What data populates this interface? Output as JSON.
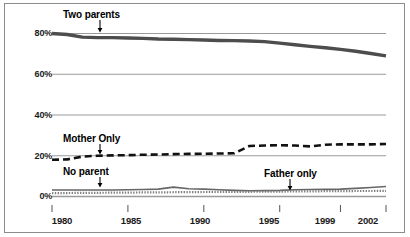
{
  "chart_data": {
    "type": "line",
    "title": "",
    "subtitle": "",
    "xlabel": "",
    "ylabel": "",
    "xlim": [
      1980,
      2002
    ],
    "ylim": [
      0,
      90
    ],
    "yticks": [
      "0%",
      "20%",
      "40%",
      "60%",
      "80%"
    ],
    "ytick_values": [
      0,
      20,
      40,
      60,
      80
    ],
    "xticks": [
      "1980",
      "1985",
      "1990",
      "1995",
      "1999",
      "2002"
    ],
    "xtick_values": [
      1980,
      1985,
      1990,
      1995,
      1999,
      2002
    ],
    "grid": "horizontal",
    "legend_position": "inline-annotations",
    "x": [
      1980,
      1981,
      1982,
      1983,
      1984,
      1985,
      1986,
      1987,
      1988,
      1989,
      1990,
      1991,
      1992,
      1993,
      1994,
      1995,
      1996,
      1997,
      1998,
      1999,
      2000,
      2001,
      2002
    ],
    "series": [
      {
        "name": "Two parents",
        "style": "solid-thick",
        "color": "#4d4d4d",
        "values": [
          80,
          79.5,
          78.2,
          78.0,
          78.0,
          77.8,
          77.6,
          77.3,
          77.2,
          77.0,
          76.8,
          76.6,
          76.5,
          76.3,
          76.0,
          75.3,
          74.5,
          73.7,
          73.0,
          72.2,
          71.3,
          70.2,
          69.0
        ]
      },
      {
        "name": "Mother Only",
        "style": "dashed",
        "color": "#111111",
        "values": [
          18.0,
          18.2,
          19.6,
          20.0,
          20.2,
          20.3,
          20.5,
          20.6,
          20.8,
          20.9,
          21.0,
          21.1,
          21.2,
          24.8,
          25.0,
          25.2,
          25.0,
          24.6,
          25.4,
          25.6,
          25.6,
          25.6,
          25.8
        ]
      },
      {
        "name": "No parent",
        "style": "solid-thin",
        "color": "#666666",
        "values": [
          3.2,
          3.2,
          3.2,
          3.2,
          3.2,
          3.3,
          3.4,
          3.6,
          4.6,
          3.8,
          3.6,
          3.3,
          3.0,
          2.8,
          2.9,
          3.0,
          3.3,
          3.4,
          3.5,
          3.6,
          4.0,
          4.4,
          4.9
        ]
      },
      {
        "name": "Father only",
        "style": "dotted",
        "color": "#808080",
        "values": [
          1.6,
          1.7,
          1.8,
          1.8,
          1.9,
          1.9,
          2.0,
          2.0,
          2.1,
          2.1,
          2.2,
          2.2,
          2.3,
          2.3,
          2.4,
          2.4,
          2.5,
          2.5,
          2.6,
          2.6,
          2.7,
          2.7,
          2.8
        ]
      }
    ],
    "annotations": [
      {
        "label": "Two parents",
        "points_to": "Two parents",
        "arrow": "down"
      },
      {
        "label": "Mother Only",
        "points_to": "Mother Only",
        "arrow": "down"
      },
      {
        "label": "No parent",
        "points_to": "No parent",
        "arrow": "down"
      },
      {
        "label": "Father only",
        "points_to": "Father only",
        "arrow": "down"
      }
    ]
  },
  "axis": {
    "y": [
      {
        "label": "80%"
      },
      {
        "label": "60%"
      },
      {
        "label": "40%"
      },
      {
        "label": "20%"
      },
      {
        "label": "0%"
      }
    ],
    "x": [
      {
        "label": "1980"
      },
      {
        "label": "1985"
      },
      {
        "label": "1990"
      },
      {
        "label": "1995"
      },
      {
        "label": "1999"
      },
      {
        "label": "2002"
      }
    ]
  },
  "annotations": {
    "two_parents": "Two parents",
    "mother_only": "Mother Only",
    "no_parent": "No parent",
    "father_only": "Father only"
  },
  "colors": {
    "frame": "#8c8c8c",
    "gridline": "#9a9a9a",
    "two_parents": "#4d4d4d",
    "mother_only": "#111111",
    "no_parent": "#666666",
    "father_only": "#808080",
    "text": "#1a1a1a",
    "background": "#ffffff"
  }
}
